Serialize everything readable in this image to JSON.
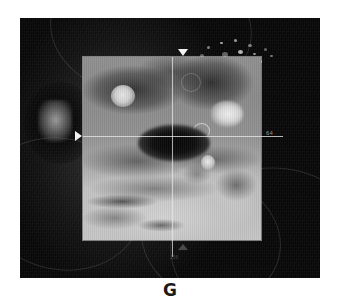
{
  "figure": {
    "panel_label": "G",
    "modality": "fundus-autofluorescence-with-oct-scan-overlay"
  },
  "fundus": {
    "name": "wide-field-fundus-image",
    "background_color": "#0a0a0a",
    "features": {
      "optic_disc": "optic-disc-bright-blob",
      "speckles_label": "hyperfluorescent-speckles",
      "speckle_count": 14
    }
  },
  "scan_panel": {
    "name": "oct-scan-region",
    "border_color": "#d7d7d7",
    "fill_color": "#8d8d8d",
    "features": {
      "fovea": "central-hypofluorescent-oval",
      "lesion_left": "bright-round-lesion-superior-nasal",
      "lesion_right": "bright-patch-superior-temporal",
      "ring_lesion": "small-ring-lesion",
      "spot_lower_right": "bright-spot-inferior-temporal"
    }
  },
  "reticle": {
    "name": "crosshair",
    "line_color": "#e8e8e8",
    "horizontal_y": 118,
    "vertical_x": 152,
    "markers": {
      "left": "position-marker-left",
      "top": "position-marker-top",
      "bottom": "position-marker-bottom"
    },
    "scan_index": "64",
    "scan_index_bottom": "256"
  },
  "speckle_positions": [
    {
      "x": 4,
      "y": 30,
      "w": 4,
      "h": 3
    },
    {
      "x": 11,
      "y": 22,
      "w": 3,
      "h": 3
    },
    {
      "x": 17,
      "y": 34,
      "w": 5,
      "h": 4
    },
    {
      "x": 24,
      "y": 18,
      "w": 3,
      "h": 2
    },
    {
      "x": 26,
      "y": 28,
      "w": 6,
      "h": 5
    },
    {
      "x": 33,
      "y": 38,
      "w": 4,
      "h": 3
    },
    {
      "x": 38,
      "y": 15,
      "w": 3,
      "h": 3
    },
    {
      "x": 42,
      "y": 26,
      "w": 5,
      "h": 4
    },
    {
      "x": 48,
      "y": 33,
      "w": 3,
      "h": 3
    },
    {
      "x": 52,
      "y": 20,
      "w": 4,
      "h": 3
    },
    {
      "x": 57,
      "y": 29,
      "w": 3,
      "h": 2
    },
    {
      "x": 62,
      "y": 36,
      "w": 4,
      "h": 3
    },
    {
      "x": 68,
      "y": 24,
      "w": 3,
      "h": 3
    },
    {
      "x": 74,
      "y": 31,
      "w": 3,
      "h": 2
    }
  ],
  "vessel_arcs": [
    {
      "x": -40,
      "y": 120,
      "w": 160,
      "h": 130,
      "rot": 12
    },
    {
      "x": 150,
      "y": 150,
      "w": 190,
      "h": 150,
      "rot": -8
    },
    {
      "x": 30,
      "y": -60,
      "w": 200,
      "h": 140,
      "rot": 5
    },
    {
      "x": 120,
      "y": 160,
      "w": 140,
      "h": 120,
      "rot": 20
    }
  ]
}
